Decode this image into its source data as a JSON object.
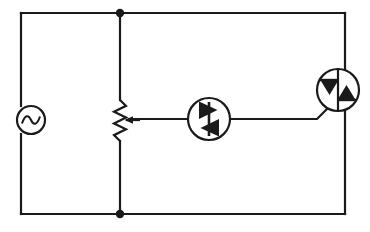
{
  "diagram": {
    "title": "AC phase-control circuit: AC source, potentiometer, DIAC, TRIAC",
    "type": "schematic",
    "width": 370,
    "height": 232,
    "background_color": "#ffffff",
    "line_color": "#1a1a1a",
    "line_width": 2.2
  },
  "frame": {
    "name": "outer-loop",
    "left_x": 21,
    "right_x": 345,
    "top_y": 13,
    "bottom_y": 214
  },
  "components": {
    "ac_source": {
      "symbol": "ac-voltage-source",
      "label": "",
      "cx": 31,
      "cy": 120,
      "r": 14
    },
    "potentiometer": {
      "symbol": "potentiometer",
      "label": "",
      "x": 120,
      "top_y": 100,
      "bottom_y": 141,
      "wiper_y": 120,
      "zigzag_amplitude": 6,
      "zigzag_segments": 6
    },
    "diac": {
      "symbol": "diac",
      "label": "",
      "cx": 209,
      "cy": 119,
      "r": 21,
      "orientation": "vertical-bar-between-opposed-triangles"
    },
    "triac": {
      "symbol": "triac",
      "label": "",
      "cx": 338,
      "cy": 90,
      "r": 21,
      "orientation": "vertical-main-terminals-gate-lower-left"
    }
  },
  "nodes": [
    {
      "name": "top-junction",
      "x": 120,
      "y": 13,
      "r": 4.2
    },
    {
      "name": "bottom-junction",
      "x": 120,
      "y": 214,
      "r": 4.2
    }
  ],
  "connections": [
    {
      "name": "left-rail-top",
      "from": "top-left-corner",
      "to": "ac-source-top"
    },
    {
      "name": "left-rail-bottom",
      "from": "ac-source-bottom",
      "to": "bottom-left-corner"
    },
    {
      "name": "top-rail",
      "from": "top-left-corner",
      "to": "top-right-corner"
    },
    {
      "name": "bottom-rail",
      "from": "bottom-left-corner",
      "to": "bottom-right-corner"
    },
    {
      "name": "pot-branch-upper",
      "from": "top-junction",
      "to": "potentiometer-top"
    },
    {
      "name": "pot-branch-lower",
      "from": "potentiometer-bottom",
      "to": "bottom-junction"
    },
    {
      "name": "wiper-to-diac",
      "from": "potentiometer-wiper",
      "to": "diac-left"
    },
    {
      "name": "diac-to-gate",
      "from": "diac-right",
      "to": "triac-gate"
    },
    {
      "name": "right-rail-upper",
      "from": "top-right-corner",
      "to": "triac-top"
    },
    {
      "name": "right-rail-lower",
      "from": "triac-bottom",
      "to": "bottom-right-corner"
    }
  ]
}
